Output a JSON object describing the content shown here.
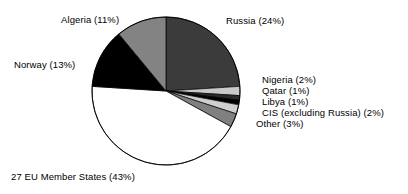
{
  "chart_data": {
    "type": "pie",
    "title": "",
    "xlabel": "",
    "ylabel": "",
    "legend_position": "callout-labels",
    "grid": false,
    "unit": "%",
    "categories": [
      "Russia",
      "Nigeria",
      "Qatar",
      "Libya",
      "CIS (excluding Russia)",
      "Other",
      "27 EU Member States",
      "Norway",
      "Algeria"
    ],
    "values": [
      24,
      2,
      1,
      1,
      2,
      3,
      43,
      13,
      11
    ],
    "labels": [
      "Russia (24%)",
      "Nigeria (2%)",
      "Qatar (1%)",
      "Libya (1%)",
      "CIS (excluding Russia) (2%)",
      "Other (3%)",
      "27 EU Member States (43%)",
      "Norway (13%)",
      "Algeria (11%)"
    ],
    "colors": [
      "#3b3b3b",
      "#c9c9c9",
      "#2b2b2b",
      "#000000",
      "#cfcfcf",
      "#808080",
      "#ffffff",
      "#000000",
      "#838383"
    ],
    "start_angle_deg": 0,
    "direction": "clockwise",
    "outline_color": "#000000"
  },
  "labels": {
    "algeria": "Algeria (11%)",
    "russia": "Russia (24%)",
    "norway": "Norway (13%)",
    "eu": "27 EU Member States (43%)",
    "nigeria": "Nigeria (2%)",
    "qatar": "Qatar (1%)",
    "libya": "Libya (1%)",
    "cis": "CIS (excluding Russia) (2%)",
    "other": "Other (3%)"
  }
}
